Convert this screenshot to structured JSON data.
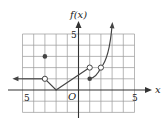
{
  "chart_data": {
    "type": "line",
    "title": "",
    "xlabel": "x",
    "ylabel": "f(x)",
    "origin_label": "O",
    "xlim": [
      -5,
      5
    ],
    "ylim": [
      -2,
      5
    ],
    "grid": true,
    "x_tick_labels": [
      {
        "value": -5,
        "label": "5"
      },
      {
        "value": 5,
        "label": "5"
      }
    ],
    "y_tick_labels": [
      {
        "value": 5,
        "label": "5"
      }
    ],
    "segments": [
      {
        "kind": "ray-left",
        "from": [
          -3,
          1
        ],
        "to": [
          -5.9,
          1
        ],
        "end_arrow": true,
        "start_marker": "open"
      },
      {
        "kind": "line",
        "points": [
          [
            -3,
            1
          ],
          [
            -2,
            0
          ],
          [
            1,
            2
          ]
        ],
        "start_marker": "open",
        "end_marker": "open"
      },
      {
        "kind": "curve",
        "points": [
          [
            1,
            1
          ],
          [
            2,
            2
          ],
          [
            3,
            5.8
          ]
        ],
        "start_marker": "filled",
        "mid_open_point": [
          2,
          2
        ],
        "end_arrow": true
      }
    ],
    "isolated_points": [
      {
        "x": -3,
        "y": 3,
        "marker": "filled"
      }
    ],
    "open_points": [
      [
        -3,
        1
      ],
      [
        1,
        2
      ],
      [
        2,
        2
      ]
    ],
    "filled_points": [
      [
        -3,
        3
      ],
      [
        1,
        1
      ]
    ]
  },
  "colors": {
    "grid": "#9a9a9a",
    "axis": "#333333",
    "curve": "#444444"
  }
}
